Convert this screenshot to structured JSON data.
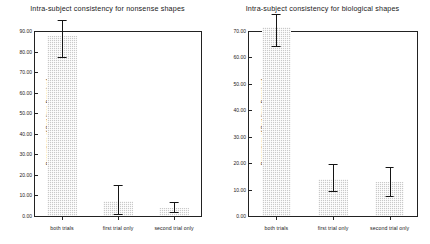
{
  "figure": {
    "background": "#ffffff",
    "bar_color": "#c9c9c9",
    "error_color": "#151515",
    "axis_color": "#222222"
  },
  "chart_data": [
    {
      "type": "bar",
      "panel": "left",
      "title": "Intra-subject consistency for nonsense shapes",
      "xlabel": "",
      "ylabel": "Percentage of Part-lines Perceived",
      "categories": [
        "both trials",
        "first trial only",
        "second trial only"
      ],
      "values": [
        87.8,
        7.5,
        4.0
      ],
      "error_low": [
        77.5,
        1.0,
        2.0
      ],
      "error_high": [
        95.5,
        15.2,
        7.0
      ],
      "ylim": [
        0,
        90
      ],
      "yticks": [
        0,
        10,
        20,
        30,
        40,
        50,
        60,
        70,
        80,
        90
      ],
      "ytick_labels": [
        "0.00",
        "10.00",
        "20.00",
        "30.00",
        "40.00",
        "50.00",
        "60.00",
        "70.00",
        "80.00",
        "90.00"
      ],
      "grid": false,
      "legend": "none"
    },
    {
      "type": "bar",
      "panel": "right",
      "title": "Intra-subject consistency for biological shapes",
      "xlabel": "",
      "ylabel": "Percentage of Part-lines Perceived",
      "categories": [
        "both trials",
        "first trial only",
        "second trial only"
      ],
      "values": [
        71.5,
        14.0,
        13.0
      ],
      "error_low": [
        64.5,
        9.5,
        7.5
      ],
      "error_high": [
        76.5,
        19.5,
        18.5
      ],
      "ylim": [
        0,
        70
      ],
      "yticks": [
        0,
        10,
        20,
        30,
        40,
        50,
        60,
        70
      ],
      "ytick_labels": [
        "0.00",
        "10.00",
        "20.00",
        "30.00",
        "40.00",
        "50.00",
        "60.00",
        "70.00"
      ],
      "grid": false,
      "legend": "none"
    }
  ]
}
